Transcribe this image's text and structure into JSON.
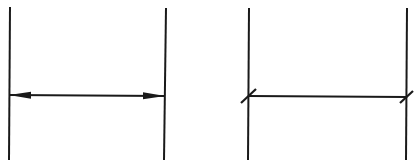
{
  "diagram": {
    "stroke_color": "#1a1a1a",
    "background": "#ffffff",
    "panels": [
      {
        "name": "arrowhead-dimension",
        "terminator": "arrowhead",
        "extension_lines": [
          {
            "x1": 10,
            "y1": 7,
            "x2": 9,
            "y2": 160
          },
          {
            "x1": 166,
            "y1": 8,
            "x2": 164,
            "y2": 160
          }
        ],
        "dimension_line": {
          "x1": 10,
          "y1": 95,
          "x2": 164,
          "y2": 96
        }
      },
      {
        "name": "oblique-tick-dimension",
        "terminator": "oblique-stroke",
        "extension_lines": [
          {
            "x1": 249,
            "y1": 8,
            "x2": 248,
            "y2": 160
          },
          {
            "x1": 407,
            "y1": 8,
            "x2": 406,
            "y2": 160
          }
        ],
        "dimension_line": {
          "x1": 249,
          "y1": 96,
          "x2": 406,
          "y2": 97
        }
      }
    ]
  }
}
